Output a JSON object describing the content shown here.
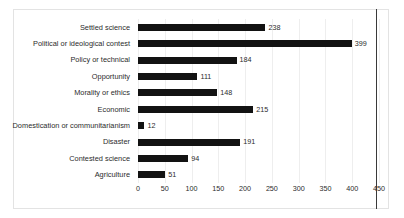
{
  "chart_data": {
    "type": "bar",
    "orientation": "horizontal",
    "title": "",
    "xlabel": "",
    "ylabel": "",
    "xlim": [
      0,
      450
    ],
    "xticks": [
      0,
      50,
      100,
      150,
      200,
      250,
      300,
      350,
      400,
      450
    ],
    "grid": true,
    "legend": false,
    "bar_color": "#121212",
    "categories": [
      "Settled science",
      "Political or ideological contest",
      "Policy or technical",
      "Opportunity",
      "Morality or ethics",
      "Economic",
      "Domestication or communitarianism",
      "Disaster",
      "Contested science",
      "Agriculture"
    ],
    "values": [
      238,
      399,
      184,
      111,
      148,
      215,
      12,
      191,
      94,
      51
    ],
    "data_labels": [
      "238",
      "399",
      "184",
      "111",
      "148",
      "215",
      "12",
      "191",
      "94",
      "51"
    ],
    "tick_labels": [
      "0",
      "50",
      "100",
      "150",
      "200",
      "250",
      "300",
      "350",
      "400",
      "450"
    ]
  }
}
